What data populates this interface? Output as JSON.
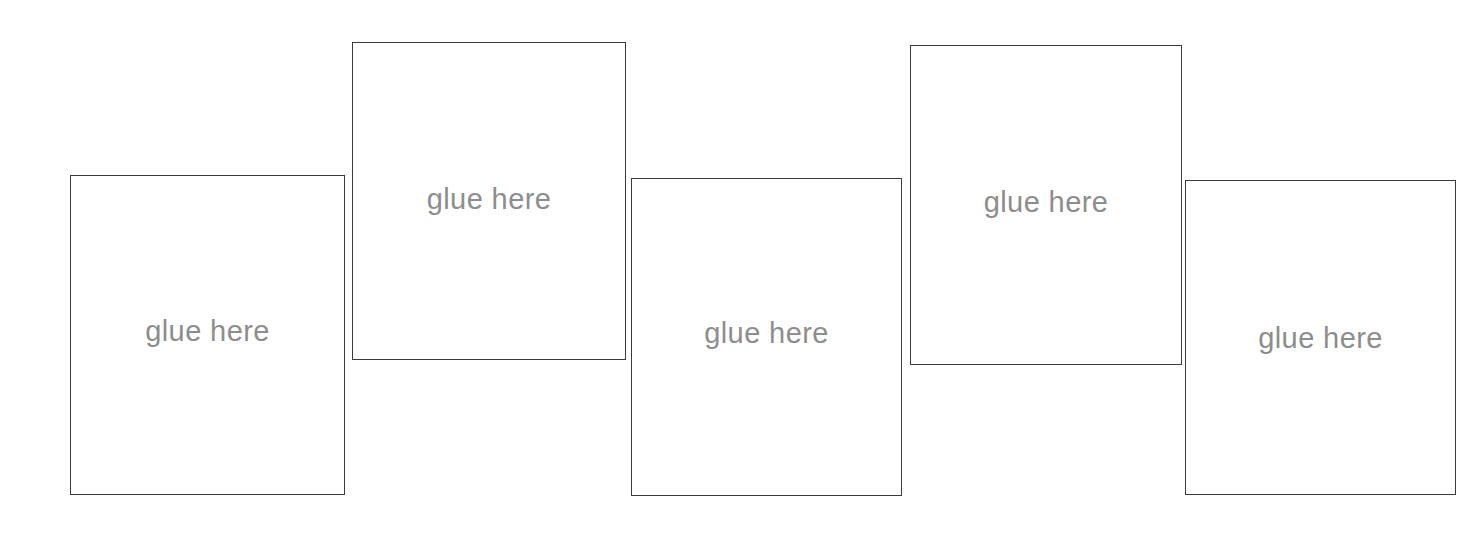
{
  "page": {
    "background_color": "#ffffff",
    "width": 1465,
    "height": 533
  },
  "style": {
    "box_border_color": "#3a3a3c",
    "box_border_width": "1.6px",
    "box_fill_color": "#ffffff",
    "label_color": "#8d8d8d",
    "label_font_size": "29px"
  },
  "boxes": [
    {
      "id": "glue-box-1",
      "label": "glue here",
      "x": 70,
      "y": 175,
      "width": 275,
      "height": 320,
      "label_center_y": 330,
      "row": "lower"
    },
    {
      "id": "glue-box-2",
      "label": "glue here",
      "x": 352,
      "y": 42,
      "width": 274,
      "height": 318,
      "label_center_y": 198,
      "row": "upper"
    },
    {
      "id": "glue-box-3",
      "label": "glue here",
      "x": 631,
      "y": 178,
      "width": 271,
      "height": 318,
      "label_center_y": 332,
      "row": "lower"
    },
    {
      "id": "glue-box-4",
      "label": "glue here",
      "x": 910,
      "y": 45,
      "width": 272,
      "height": 320,
      "label_center_y": 201,
      "row": "upper"
    },
    {
      "id": "glue-box-5",
      "label": "glue here",
      "x": 1185,
      "y": 180,
      "width": 271,
      "height": 315,
      "label_center_y": 337,
      "row": "lower"
    }
  ]
}
